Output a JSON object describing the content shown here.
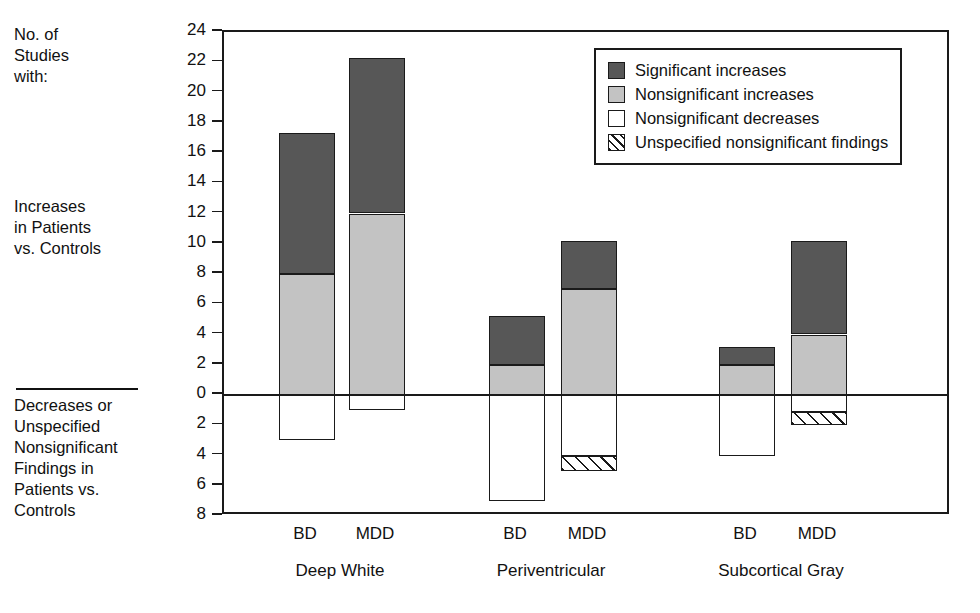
{
  "side_labels": {
    "top": "No. of\nStudies\nwith:",
    "middle": "Increases\nin Patients\nvs. Controls",
    "bottom": "Decreases or\nUnspecified\nNonsignificant\nFindings in\nPatients vs.\nControls"
  },
  "legend": {
    "items": [
      {
        "label": "Significant increases",
        "key": "significant_increases",
        "color": "#575757",
        "pattern": "solid"
      },
      {
        "label": "Nonsignificant increases",
        "key": "nonsignificant_increases",
        "color": "#c3c3c3",
        "pattern": "solid"
      },
      {
        "label": "Nonsignificant decreases",
        "key": "nonsignificant_decreases",
        "color": "#ffffff",
        "pattern": "solid"
      },
      {
        "label": "Unspecified nonsignificant findings",
        "key": "unspecified_nonsignificant_findings",
        "color": "#ffffff",
        "pattern": "diagonal-hatch"
      }
    ]
  },
  "chart_data": {
    "type": "bar",
    "subtype": "stacked-diverging",
    "title": "",
    "xlabel": "",
    "ylabel": "No. of Studies with:",
    "ylim": [
      -8,
      24
    ],
    "ytick_step": 2,
    "ytick_labels": [
      "24",
      "22",
      "20",
      "18",
      "16",
      "14",
      "12",
      "10",
      "8",
      "6",
      "4",
      "2",
      "0",
      "2",
      "4",
      "6",
      "8"
    ],
    "ytick_values": [
      24,
      22,
      20,
      18,
      16,
      14,
      12,
      10,
      8,
      6,
      4,
      2,
      0,
      -2,
      -4,
      -6,
      -8
    ],
    "grid": false,
    "legend_position": "top-right",
    "groups": [
      "Deep White",
      "Periventricular",
      "Subcortical Gray"
    ],
    "subgroups": [
      "BD",
      "MDD"
    ],
    "series": [
      {
        "name": "Significant increases",
        "values": [
          9.3,
          10.3,
          3.2,
          3.2,
          1.2,
          6.2
        ]
      },
      {
        "name": "Nonsignificant increases",
        "values": [
          8.0,
          12.0,
          2.0,
          7.0,
          2.0,
          4.0
        ]
      },
      {
        "name": "Nonsignificant decreases",
        "values": [
          -3.0,
          -1.0,
          -7.0,
          -4.0,
          -4.0,
          -1.2
        ]
      },
      {
        "name": "Unspecified nonsignificant findings",
        "values": [
          0,
          0,
          0,
          -1.0,
          0,
          -0.9
        ]
      }
    ],
    "bars": [
      {
        "group": "Deep White",
        "subgroup": "BD",
        "significant_increases_top": 17.3,
        "nonsignificant_increases_top": 8.0,
        "nonsignificant_decreases_bottom": -3.0,
        "unspecified_bottom": -3.0
      },
      {
        "group": "Deep White",
        "subgroup": "MDD",
        "significant_increases_top": 22.3,
        "nonsignificant_increases_top": 12.0,
        "nonsignificant_decreases_bottom": -1.0,
        "unspecified_bottom": -1.0
      },
      {
        "group": "Periventricular",
        "subgroup": "BD",
        "significant_increases_top": 5.2,
        "nonsignificant_increases_top": 2.0,
        "nonsignificant_decreases_bottom": -7.0,
        "unspecified_bottom": -7.0
      },
      {
        "group": "Periventricular",
        "subgroup": "MDD",
        "significant_increases_top": 10.2,
        "nonsignificant_increases_top": 7.0,
        "nonsignificant_decreases_bottom": -4.0,
        "unspecified_bottom": -5.0
      },
      {
        "group": "Subcortical Gray",
        "subgroup": "BD",
        "significant_increases_top": 3.2,
        "nonsignificant_increases_top": 2.0,
        "nonsignificant_decreases_bottom": -4.0,
        "unspecified_bottom": -4.0
      },
      {
        "group": "Subcortical Gray",
        "subgroup": "MDD",
        "significant_increases_top": 10.2,
        "nonsignificant_increases_top": 4.0,
        "nonsignificant_decreases_bottom": -1.1,
        "unspecified_bottom": -2.0
      }
    ]
  },
  "axis_labels": {
    "subgroup_bd": "BD",
    "subgroup_mdd": "MDD",
    "group_1": "Deep White",
    "group_2": "Periventricular",
    "group_3": "Subcortical Gray"
  }
}
